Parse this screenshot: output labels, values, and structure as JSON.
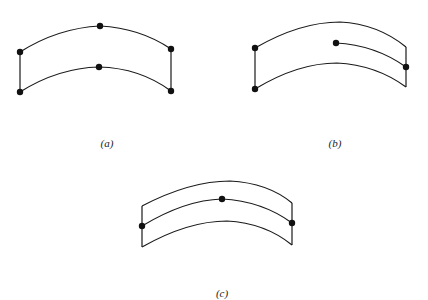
{
  "figure": {
    "panels": [
      {
        "id": "a",
        "label": "(a)",
        "description": "Curved band with two arcs, both closed at the left and right by vertical edges; six nodes (three on each arc)"
      },
      {
        "id": "b",
        "label": "(b)",
        "description": "Curved band with top and bottom arcs; left edge closed with two nodes; an inner arc starts at an interior node and ends at a node on the right edge"
      },
      {
        "id": "c",
        "label": "(c)",
        "description": "Curved band with three arcs; middle arc carries three nodes (left edge, center, right edge)"
      }
    ],
    "colors": {
      "stroke": "#1a1a1a",
      "node": "#111111",
      "background": "#ffffff"
    }
  }
}
